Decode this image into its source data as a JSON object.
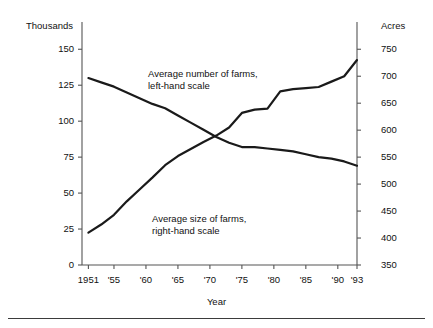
{
  "figure": {
    "left_axis_unit": "Thousands",
    "right_axis_unit": "Acres",
    "x_axis_title": "Year",
    "annotation_farms": {
      "line1": "Average number of farms,",
      "line2": "left-hand scale"
    },
    "annotation_size": {
      "line1": "Average size of farms,",
      "line2": "right-hand scale"
    },
    "line_color": "#1a1a1a",
    "axis_color": "#555555",
    "rule_color": "#3b3b3b"
  },
  "chart_data": {
    "type": "line",
    "title": "",
    "xlabel": "Year",
    "ylabel": "Thousands",
    "y2label": "Acres",
    "grid": false,
    "legend": "inline-annotations",
    "xlim": [
      1950,
      1993
    ],
    "ylim": [
      0,
      162
    ],
    "y2lim": [
      350,
      782
    ],
    "yticks": [
      0,
      25,
      50,
      75,
      100,
      125,
      150
    ],
    "ytick_labels": [
      "0",
      "25",
      "50",
      "75",
      "100",
      "125",
      "150"
    ],
    "y2ticks": [
      350,
      400,
      450,
      500,
      550,
      600,
      650,
      700,
      750
    ],
    "y2tick_labels": [
      "350",
      "400",
      "450",
      "500",
      "550",
      "600",
      "650",
      "700",
      "750"
    ],
    "xticks": [
      1951,
      1955,
      1960,
      1965,
      1970,
      1975,
      1980,
      1985,
      1990,
      1993
    ],
    "xtick_labels": [
      "1951",
      "'55",
      "'60",
      "'65",
      "'70",
      "'75",
      "'80",
      "'85",
      "'90",
      "'93"
    ],
    "series": [
      {
        "name": "Average number of farms, left-hand scale",
        "axis": "left",
        "unit": "thousands",
        "x": [
          1951,
          1953,
          1955,
          1957,
          1959,
          1961,
          1963,
          1965,
          1967,
          1969,
          1971,
          1973,
          1975,
          1977,
          1979,
          1981,
          1983,
          1985,
          1987,
          1989,
          1991,
          1993
        ],
        "values": [
          130,
          127,
          124,
          120,
          116,
          112,
          109,
          104,
          99,
          94,
          89,
          85,
          82,
          82,
          81,
          80,
          79,
          77,
          75,
          74,
          72,
          69
        ]
      },
      {
        "name": "Average size of farms, right-hand scale",
        "axis": "right",
        "unit": "acres",
        "x": [
          1951,
          1953,
          1955,
          1957,
          1959,
          1961,
          1963,
          1965,
          1967,
          1969,
          1971,
          1973,
          1975,
          1977,
          1979,
          1981,
          1983,
          1985,
          1987,
          1989,
          1991,
          1993
        ],
        "values": [
          410,
          425,
          443,
          468,
          490,
          512,
          535,
          552,
          565,
          578,
          590,
          605,
          632,
          638,
          640,
          672,
          676,
          678,
          680,
          690,
          700,
          730
        ]
      }
    ]
  }
}
